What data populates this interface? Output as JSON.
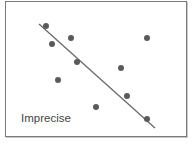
{
  "label": "Imprecise",
  "colors": {
    "dot": "#5a5a5a",
    "line": "#6a6a6a",
    "border": "#7a7a7a"
  },
  "chart_data": {
    "type": "scatter",
    "title": "",
    "annotation": "Imprecise",
    "points": [
      {
        "x": 46,
        "y": 26
      },
      {
        "x": 52,
        "y": 44
      },
      {
        "x": 71,
        "y": 38
      },
      {
        "x": 77,
        "y": 62
      },
      {
        "x": 58,
        "y": 80
      },
      {
        "x": 96,
        "y": 107
      },
      {
        "x": 121,
        "y": 68
      },
      {
        "x": 127,
        "y": 96
      },
      {
        "x": 147,
        "y": 38
      },
      {
        "x": 147,
        "y": 119
      }
    ],
    "fit_line": {
      "x1": 39,
      "y1": 24,
      "x2": 155,
      "y2": 128
    },
    "grid": false,
    "axes": false
  }
}
